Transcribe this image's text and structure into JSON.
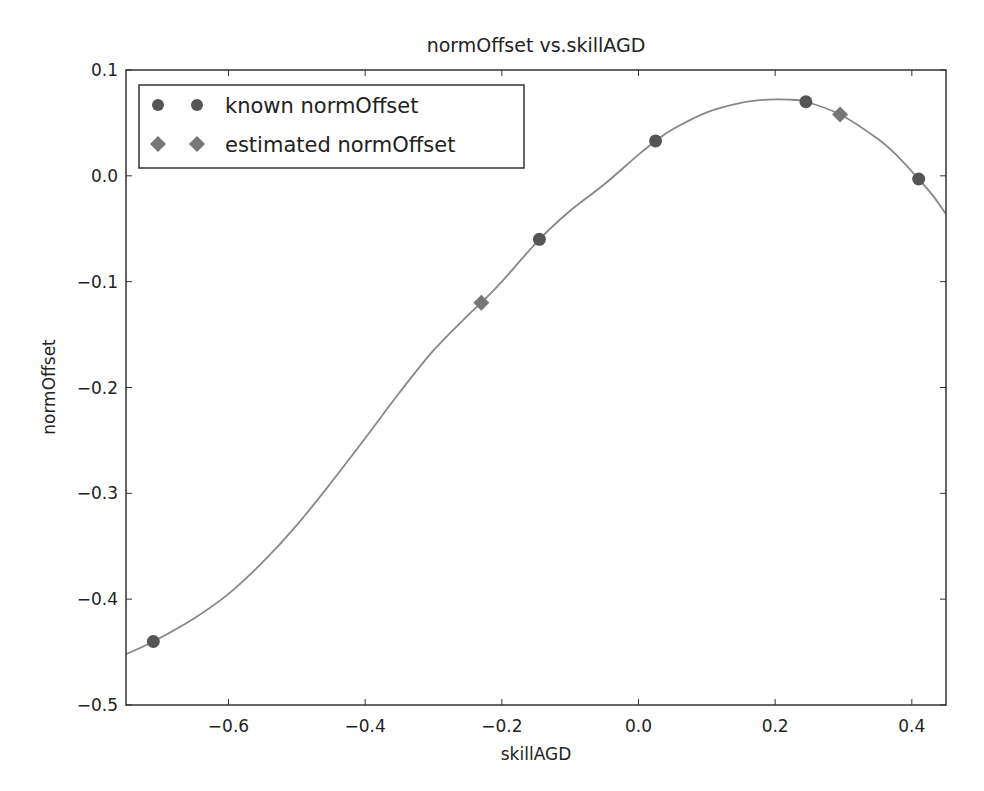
{
  "chart_data": {
    "type": "scatter",
    "title": "normOffset vs.skillAGD",
    "xlabel": "skillAGD",
    "ylabel": "normOffset",
    "xlim": [
      -0.75,
      0.45
    ],
    "ylim": [
      -0.5,
      0.1
    ],
    "xticks": [
      -0.6,
      -0.4,
      -0.2,
      0.0,
      0.2,
      0.4
    ],
    "xtick_labels": [
      "−0.6",
      "−0.4",
      "−0.2",
      "0.0",
      "0.2",
      "0.4"
    ],
    "yticks": [
      0.1,
      0.0,
      -0.1,
      -0.2,
      -0.3,
      -0.4,
      -0.5
    ],
    "ytick_labels": [
      "0.1",
      "0.0",
      "−0.1",
      "−0.2",
      "−0.3",
      "−0.4",
      "−0.5"
    ],
    "grid": false,
    "legend_position": "upper left",
    "series": [
      {
        "name": "known normOffset",
        "marker": "circle",
        "color": "#555555",
        "points": [
          {
            "x": -0.71,
            "y": -0.44
          },
          {
            "x": -0.145,
            "y": -0.06
          },
          {
            "x": 0.025,
            "y": 0.033
          },
          {
            "x": 0.245,
            "y": 0.07
          },
          {
            "x": 0.41,
            "y": -0.003
          }
        ]
      },
      {
        "name": "estimated normOffset",
        "marker": "diamond",
        "color": "#777777",
        "points": [
          {
            "x": -0.23,
            "y": -0.12
          },
          {
            "x": 0.295,
            "y": 0.058
          }
        ]
      },
      {
        "name": "fitted curve",
        "marker": "line",
        "color": "#888888",
        "points": [
          {
            "x": -0.75,
            "y": -0.452
          },
          {
            "x": -0.71,
            "y": -0.44
          },
          {
            "x": -0.65,
            "y": -0.418
          },
          {
            "x": -0.6,
            "y": -0.395
          },
          {
            "x": -0.55,
            "y": -0.365
          },
          {
            "x": -0.5,
            "y": -0.33
          },
          {
            "x": -0.45,
            "y": -0.29
          },
          {
            "x": -0.4,
            "y": -0.248
          },
          {
            "x": -0.35,
            "y": -0.205
          },
          {
            "x": -0.3,
            "y": -0.165
          },
          {
            "x": -0.25,
            "y": -0.132
          },
          {
            "x": -0.23,
            "y": -0.12
          },
          {
            "x": -0.2,
            "y": -0.1
          },
          {
            "x": -0.145,
            "y": -0.06
          },
          {
            "x": -0.1,
            "y": -0.033
          },
          {
            "x": -0.05,
            "y": -0.008
          },
          {
            "x": 0.0,
            "y": 0.02
          },
          {
            "x": 0.025,
            "y": 0.033
          },
          {
            "x": 0.05,
            "y": 0.044
          },
          {
            "x": 0.1,
            "y": 0.06
          },
          {
            "x": 0.15,
            "y": 0.069
          },
          {
            "x": 0.19,
            "y": 0.072
          },
          {
            "x": 0.22,
            "y": 0.072
          },
          {
            "x": 0.245,
            "y": 0.07
          },
          {
            "x": 0.295,
            "y": 0.058
          },
          {
            "x": 0.35,
            "y": 0.035
          },
          {
            "x": 0.38,
            "y": 0.018
          },
          {
            "x": 0.41,
            "y": -0.003
          },
          {
            "x": 0.43,
            "y": -0.018
          },
          {
            "x": 0.45,
            "y": -0.036
          }
        ]
      }
    ]
  },
  "legend": {
    "items": [
      {
        "label": "known normOffset",
        "marker": "circle"
      },
      {
        "label": "estimated normOffset",
        "marker": "diamond"
      }
    ]
  },
  "colors": {
    "axes": "#333333",
    "curve": "#888888",
    "known_marker": "#555555",
    "estimated_marker": "#777777"
  }
}
